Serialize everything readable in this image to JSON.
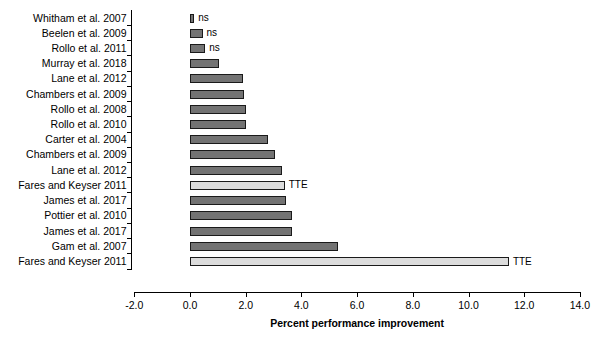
{
  "chart_data": {
    "type": "bar",
    "orientation": "horizontal",
    "title": "",
    "xlabel": "Percent performance improvement",
    "ylabel": "",
    "xlim": [
      -2.0,
      14.0
    ],
    "xticks": [
      "-2.0",
      "0.0",
      "2.0",
      "4.0",
      "6.0",
      "8.0",
      "10.0",
      "12.0",
      "14.0"
    ],
    "xtick_values": [
      -2.0,
      0.0,
      2.0,
      4.0,
      6.0,
      8.0,
      10.0,
      12.0,
      14.0
    ],
    "grid": false,
    "legend": "none",
    "categories": [
      "Whitham et al. 2007",
      "Beelen et al. 2009",
      "Rollo et al. 2011",
      "Murray et al. 2018",
      "Lane et al. 2012",
      "Chambers et al. 2009",
      "Rollo et al. 2008",
      "Rollo et al. 2010",
      "Carter et al. 2004",
      "Chambers et al. 2009",
      "Lane et al. 2012",
      "Fares and Keyser 2011",
      "James et al. 2017",
      "Pottier et al. 2010",
      "James et al. 2017",
      "Gam et al. 2007",
      "Fares and Keyser 2011"
    ],
    "values": [
      0.15,
      0.45,
      0.55,
      1.05,
      1.9,
      1.95,
      2.0,
      2.0,
      2.8,
      3.05,
      3.3,
      3.4,
      3.45,
      3.65,
      3.65,
      5.3,
      11.45
    ],
    "styles": [
      "dark",
      "dark",
      "dark",
      "dark",
      "dark",
      "dark",
      "dark",
      "dark",
      "dark",
      "dark",
      "dark",
      "light",
      "dark",
      "dark",
      "dark",
      "dark",
      "light"
    ],
    "annotations": [
      "ns",
      "ns",
      "ns",
      "",
      "",
      "",
      "",
      "",
      "",
      "",
      "",
      "TTE",
      "",
      "",
      "",
      "",
      "TTE"
    ],
    "colors": {
      "dark_bar": "#737373",
      "light_bar": "#dcdcdc",
      "bar_border": "#1a1a1a",
      "axis": "#000000",
      "background": "#ffffff"
    }
  }
}
